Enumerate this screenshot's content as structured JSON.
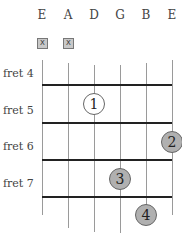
{
  "diagram": {
    "type": "guitar-chord-chart",
    "strings": [
      {
        "name": "E",
        "x": 42,
        "muted": true,
        "top": 60,
        "bottom": 215
      },
      {
        "name": "A",
        "x": 68,
        "muted": true,
        "top": 63,
        "bottom": 228
      },
      {
        "name": "D",
        "x": 94,
        "muted": false,
        "top": 65,
        "bottom": 232
      },
      {
        "name": "G",
        "x": 120,
        "muted": false,
        "top": 65,
        "bottom": 233
      },
      {
        "name": "B",
        "x": 146,
        "muted": false,
        "top": 63,
        "bottom": 224
      },
      {
        "name": "E",
        "x": 172,
        "muted": false,
        "top": 60,
        "bottom": 215
      }
    ],
    "mute_symbol": "X",
    "frets": [
      {
        "label": "fret 4",
        "label_y": 67
      },
      {
        "label": "fret 5",
        "label_y": 104
      },
      {
        "label": "fret 6",
        "label_y": 140
      },
      {
        "label": "fret 7",
        "label_y": 177
      }
    ],
    "fret_lines_y": [
      85,
      123,
      160,
      197
    ],
    "fingers": [
      {
        "number": "1",
        "string": "D",
        "x": 94,
        "y": 104,
        "style": "white"
      },
      {
        "number": "2",
        "string": "E",
        "x": 172,
        "y": 142,
        "style": "gray"
      },
      {
        "number": "3",
        "string": "G",
        "x": 120,
        "y": 179,
        "style": "gray"
      },
      {
        "number": "4",
        "string": "B",
        "x": 146,
        "y": 215,
        "style": "gray"
      }
    ],
    "colors": {
      "finger_fill_gray": "#b0b0b0",
      "finger_fill_white": "#ffffff",
      "fret_line": "#222222",
      "string_line": "#9a9a9a"
    }
  }
}
